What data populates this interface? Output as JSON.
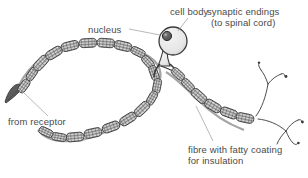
{
  "figure": {
    "background_color": "#ffffff",
    "line_color": "#3a3a3a",
    "label_color": "#4a4a4a",
    "cell_body_fill": "#e8e8e8",
    "myelin_fill": "#9a9a9a",
    "caption": ""
  },
  "labels": {
    "nucleus": "nucleus",
    "cell_body": "cell body",
    "synaptic_endings_line1": "synaptic endings",
    "synaptic_endings_line2": "(to spinal cord)",
    "from_receptor": "from receptor",
    "fibre_line1": "fibre with fatty coating",
    "fibre_line2": "for insulation"
  },
  "parts": {
    "dendrite_tip": "dendrite-tip",
    "axon": "myelinated-axon",
    "cell_body": "cell-body",
    "nucleus": "nucleus",
    "synaptic_terminals": "synaptic-terminals"
  }
}
